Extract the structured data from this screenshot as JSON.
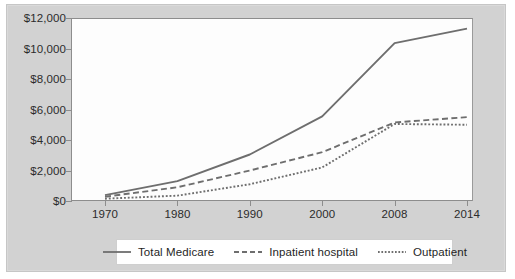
{
  "chart_data": {
    "type": "line",
    "title": "",
    "xlabel": "",
    "ylabel": "",
    "x": [
      "1970",
      "1980",
      "1990",
      "2000",
      "2008",
      "2014"
    ],
    "categories": [
      "1970",
      "1980",
      "1990",
      "2000",
      "2008",
      "2014"
    ],
    "ylim": [
      0,
      12000
    ],
    "yticks": [
      0,
      2000,
      4000,
      6000,
      8000,
      10000,
      12000
    ],
    "ytick_labels": [
      "$0",
      "$2,000",
      "$4,000",
      "$6,000",
      "$8,000",
      "$10,000",
      "$12,000"
    ],
    "xtick_labels": [
      "1970",
      "1980",
      "1990",
      "2000",
      "2008",
      "2014"
    ],
    "grid": false,
    "legend_position": "bottom",
    "series": [
      {
        "name": "Total Medicare",
        "style": "solid",
        "color": "#6e6e6e",
        "values": [
          385,
          1300,
          3050,
          5550,
          10350,
          11300
        ]
      },
      {
        "name": "Inpatient hospital",
        "style": "dashed",
        "color": "#6e6e6e",
        "values": [
          280,
          900,
          2000,
          3200,
          5150,
          5500
        ]
      },
      {
        "name": "Outpatient",
        "style": "dotted",
        "color": "#6e6e6e",
        "values": [
          150,
          350,
          1100,
          2200,
          5050,
          5000
        ]
      }
    ]
  },
  "legend": {
    "items": [
      {
        "label": "Total Medicare",
        "swatch": "solid-line-icon"
      },
      {
        "label": "Inpatient hospital",
        "swatch": "dashed-line-icon"
      },
      {
        "label": "Outpatient",
        "swatch": "dotted-line-icon"
      }
    ]
  },
  "colors": {
    "plate": "#d2d2d2",
    "plot_background": "#fdfdfd",
    "axis": "#8d8d8d",
    "line": "#6e6e6e",
    "text": "#2b2b2b"
  }
}
